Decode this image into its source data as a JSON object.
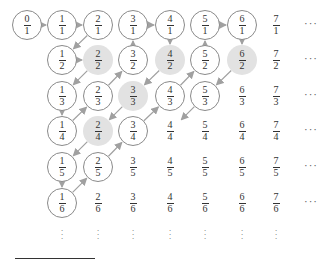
{
  "diagram": {
    "columns_x": [
      27,
      62,
      98,
      133,
      170,
      205,
      242,
      276
    ],
    "rows_y": [
      25,
      60,
      96,
      131,
      167,
      203
    ],
    "ellipsis_x": 312,
    "vdots_y": 236,
    "colors": {
      "circle_stroke": "#8a8a8a",
      "shade": "#e2e2e2",
      "arrow": "#a0a0a0",
      "text": "#333333"
    },
    "cells": [
      {
        "n": "0",
        "d": "1",
        "col": 0,
        "row": 0,
        "style": "circled"
      },
      {
        "n": "1",
        "d": "1",
        "col": 1,
        "row": 0,
        "style": "circled"
      },
      {
        "n": "2",
        "d": "1",
        "col": 2,
        "row": 0,
        "style": "circled"
      },
      {
        "n": "3",
        "d": "1",
        "col": 3,
        "row": 0,
        "style": "circled"
      },
      {
        "n": "4",
        "d": "1",
        "col": 4,
        "row": 0,
        "style": "circled"
      },
      {
        "n": "5",
        "d": "1",
        "col": 5,
        "row": 0,
        "style": "circled"
      },
      {
        "n": "6",
        "d": "1",
        "col": 6,
        "row": 0,
        "style": "circled"
      },
      {
        "n": "7",
        "d": "1",
        "col": 7,
        "row": 0,
        "style": "plain"
      },
      {
        "n": "1",
        "d": "2",
        "col": 1,
        "row": 1,
        "style": "circled"
      },
      {
        "n": "2",
        "d": "2",
        "col": 2,
        "row": 1,
        "style": "shaded"
      },
      {
        "n": "3",
        "d": "2",
        "col": 3,
        "row": 1,
        "style": "circled"
      },
      {
        "n": "4",
        "d": "2",
        "col": 4,
        "row": 1,
        "style": "shaded"
      },
      {
        "n": "5",
        "d": "2",
        "col": 5,
        "row": 1,
        "style": "circled"
      },
      {
        "n": "6",
        "d": "2",
        "col": 6,
        "row": 1,
        "style": "shaded"
      },
      {
        "n": "7",
        "d": "2",
        "col": 7,
        "row": 1,
        "style": "plain"
      },
      {
        "n": "1",
        "d": "3",
        "col": 1,
        "row": 2,
        "style": "circled"
      },
      {
        "n": "2",
        "d": "3",
        "col": 2,
        "row": 2,
        "style": "circled"
      },
      {
        "n": "3",
        "d": "3",
        "col": 3,
        "row": 2,
        "style": "shaded"
      },
      {
        "n": "4",
        "d": "3",
        "col": 4,
        "row": 2,
        "style": "circled"
      },
      {
        "n": "5",
        "d": "3",
        "col": 5,
        "row": 2,
        "style": "circled"
      },
      {
        "n": "6",
        "d": "3",
        "col": 6,
        "row": 2,
        "style": "plain"
      },
      {
        "n": "7",
        "d": "3",
        "col": 7,
        "row": 2,
        "style": "plain"
      },
      {
        "n": "1",
        "d": "4",
        "col": 1,
        "row": 3,
        "style": "circled"
      },
      {
        "n": "2",
        "d": "4",
        "col": 2,
        "row": 3,
        "style": "shaded"
      },
      {
        "n": "3",
        "d": "4",
        "col": 3,
        "row": 3,
        "style": "circled"
      },
      {
        "n": "4",
        "d": "4",
        "col": 4,
        "row": 3,
        "style": "plain"
      },
      {
        "n": "5",
        "d": "4",
        "col": 5,
        "row": 3,
        "style": "plain"
      },
      {
        "n": "6",
        "d": "4",
        "col": 6,
        "row": 3,
        "style": "plain"
      },
      {
        "n": "7",
        "d": "4",
        "col": 7,
        "row": 3,
        "style": "plain"
      },
      {
        "n": "1",
        "d": "5",
        "col": 1,
        "row": 4,
        "style": "circled"
      },
      {
        "n": "2",
        "d": "5",
        "col": 2,
        "row": 4,
        "style": "circled"
      },
      {
        "n": "3",
        "d": "5",
        "col": 3,
        "row": 4,
        "style": "plain"
      },
      {
        "n": "4",
        "d": "5",
        "col": 4,
        "row": 4,
        "style": "plain"
      },
      {
        "n": "5",
        "d": "5",
        "col": 5,
        "row": 4,
        "style": "plain"
      },
      {
        "n": "6",
        "d": "5",
        "col": 6,
        "row": 4,
        "style": "plain"
      },
      {
        "n": "7",
        "d": "5",
        "col": 7,
        "row": 4,
        "style": "plain"
      },
      {
        "n": "1",
        "d": "6",
        "col": 1,
        "row": 5,
        "style": "circled"
      },
      {
        "n": "2",
        "d": "6",
        "col": 2,
        "row": 5,
        "style": "plain"
      },
      {
        "n": "3",
        "d": "6",
        "col": 3,
        "row": 5,
        "style": "plain"
      },
      {
        "n": "4",
        "d": "6",
        "col": 4,
        "row": 5,
        "style": "plain"
      },
      {
        "n": "5",
        "d": "6",
        "col": 5,
        "row": 5,
        "style": "plain"
      },
      {
        "n": "6",
        "d": "6",
        "col": 6,
        "row": 5,
        "style": "plain"
      },
      {
        "n": "7",
        "d": "6",
        "col": 7,
        "row": 5,
        "style": "plain"
      }
    ],
    "arrows": [
      [
        0,
        0,
        1,
        0
      ],
      [
        1,
        0,
        2,
        0
      ],
      [
        2,
        0,
        1,
        1
      ],
      [
        1,
        1,
        2,
        1
      ],
      [
        2,
        1,
        1,
        2
      ],
      [
        1,
        2,
        1,
        3
      ],
      [
        1,
        3,
        2,
        2
      ],
      [
        2,
        2,
        3,
        1
      ],
      [
        3,
        1,
        3,
        0
      ],
      [
        3,
        0,
        4,
        0
      ],
      [
        4,
        0,
        4,
        1
      ],
      [
        4,
        1,
        3,
        2
      ],
      [
        3,
        2,
        2,
        3
      ],
      [
        2,
        3,
        1,
        4
      ],
      [
        1,
        4,
        1,
        5
      ],
      [
        1,
        5,
        2,
        4
      ],
      [
        2,
        4,
        3,
        3
      ],
      [
        3,
        3,
        4,
        2
      ],
      [
        4,
        2,
        5,
        1
      ],
      [
        5,
        1,
        5,
        0
      ],
      [
        5,
        0,
        6,
        0
      ],
      [
        6,
        0,
        6,
        1
      ],
      [
        6,
        1,
        5,
        2
      ],
      [
        5,
        2,
        4,
        3
      ]
    ],
    "ellipsis": "···",
    "vdots": "⋮"
  }
}
